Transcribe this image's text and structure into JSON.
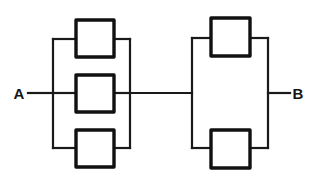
{
  "diagram": {
    "type": "electrical-network-schematic",
    "background_color": "#ffffff",
    "line_color": "#1a1a1a",
    "component_stroke_color": "#111111",
    "component_fill_color": "#ffffff",
    "wire_width": 2.2,
    "component_width": 3.4,
    "terminals": [
      {
        "id": "A",
        "label": "A",
        "x": 19,
        "y": 93,
        "lead_from_x": 28,
        "lead_to_x": 53
      },
      {
        "id": "B",
        "label": "B",
        "x": 297,
        "y": 93,
        "lead_from_x": 268,
        "lead_to_x": 290
      }
    ],
    "groups": [
      {
        "id": "left-group",
        "name": "left-parallel-bank",
        "element_count": 3,
        "bus_left_x": 53,
        "bus_right_x": 130,
        "bus_top_y": 39,
        "bus_bottom_y": 148,
        "mid_y": 93,
        "components": [
          {
            "id": "left-top",
            "name": "resistor-left-top",
            "x": 76,
            "y": 20,
            "w": 38,
            "h": 37,
            "branch_y": 39
          },
          {
            "id": "left-middle",
            "name": "resistor-left-middle",
            "x": 76,
            "y": 75,
            "w": 38,
            "h": 37,
            "branch_y": 93
          },
          {
            "id": "left-bottom",
            "name": "resistor-left-bottom",
            "x": 76,
            "y": 130,
            "w": 38,
            "h": 37,
            "branch_y": 148
          }
        ]
      },
      {
        "id": "right-group",
        "name": "right-parallel-bank",
        "element_count": 2,
        "bus_left_x": 192,
        "bus_right_x": 268,
        "bus_top_y": 38,
        "bus_bottom_y": 148,
        "mid_y": 93,
        "components": [
          {
            "id": "right-top",
            "name": "resistor-right-top",
            "x": 211,
            "y": 18,
            "w": 39,
            "h": 38,
            "branch_y": 38
          },
          {
            "id": "right-bottom",
            "name": "resistor-right-bottom",
            "x": 211,
            "y": 130,
            "w": 39,
            "h": 38,
            "branch_y": 148
          }
        ]
      }
    ],
    "connector": {
      "id": "interconnect",
      "name": "series-link-wire",
      "from_x": 130,
      "to_x": 192,
      "y": 93
    }
  }
}
